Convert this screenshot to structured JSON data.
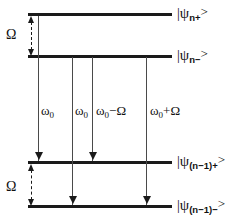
{
  "figure": {
    "background_color": "#ffffff",
    "line_color": "#1a1a1a",
    "arrow_color": "#4a4a4a"
  },
  "levels": [
    {
      "id": "n-plus",
      "label_prefix": "|",
      "psi": "ψ",
      "sub": "n+",
      "ket": ">",
      "y": 13
    },
    {
      "id": "n-minus",
      "label_prefix": "|",
      "psi": "ψ",
      "sub": "n−",
      "ket": ">",
      "y": 55
    },
    {
      "id": "n1-plus",
      "label_prefix": "|",
      "psi": "ψ",
      "sub": "(n−1)+",
      "ket": ">",
      "y": 161
    },
    {
      "id": "n1-minus",
      "label_prefix": "|",
      "psi": "ψ",
      "sub": "(n−1)−",
      "ket": ">",
      "y": 205
    }
  ],
  "splittings": [
    {
      "id": "upper-omega",
      "label": "Ω"
    },
    {
      "id": "lower-omega",
      "label": "Ω"
    }
  ],
  "transitions": [
    {
      "id": "t1",
      "omega": "ω",
      "sub": "0",
      "suffix": "",
      "x": 38,
      "from_level": "n-minus",
      "to_level": "n1-plus"
    },
    {
      "id": "t2",
      "omega": "ω",
      "sub": "0",
      "suffix": "",
      "x": 72,
      "from_level": "n-minus",
      "to_level": "n1-minus"
    },
    {
      "id": "t3",
      "omega": "ω",
      "sub": "0",
      "suffix": "−Ω",
      "x": 92,
      "from_level": "n-minus",
      "to_level": "n1-plus"
    },
    {
      "id": "t4",
      "omega": "ω",
      "sub": "0",
      "suffix": "+Ω",
      "x": 146,
      "from_level": "n-minus",
      "to_level": "n1-minus"
    }
  ]
}
